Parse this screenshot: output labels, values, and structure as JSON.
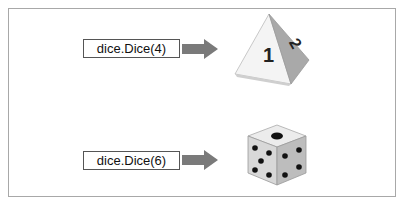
{
  "caption_partial": "",
  "rows": [
    {
      "label": "dice.Dice(4)",
      "die": "d4-tetrahedron",
      "faces_visible": [
        "1",
        "2"
      ]
    },
    {
      "label": "dice.Dice(6)",
      "die": "d6-cube",
      "faces_visible": [
        "1",
        "5",
        "4"
      ]
    }
  ],
  "colors": {
    "arrow": "#7a7a7a",
    "border": "#a8a8a8",
    "pip": "#111111"
  }
}
